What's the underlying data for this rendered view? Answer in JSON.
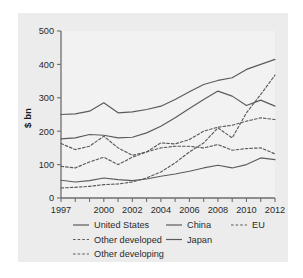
{
  "chart_data": {
    "type": "line",
    "title": "",
    "xlabel": "",
    "ylabel": "$ bn",
    "xlim": [
      1997,
      2012
    ],
    "ylim": [
      0,
      500
    ],
    "yticks": [
      0,
      100,
      200,
      300,
      400,
      500
    ],
    "yticklabels": [
      "0",
      "100",
      "200",
      "300",
      "400",
      "500"
    ],
    "x": [
      1997,
      1998,
      1999,
      2000,
      2001,
      2002,
      2003,
      2004,
      2005,
      2006,
      2007,
      2008,
      2009,
      2010,
      2011,
      2012
    ],
    "xticks": [
      1997,
      1998,
      1999,
      2000,
      2001,
      2002,
      2003,
      2004,
      2005,
      2006,
      2007,
      2008,
      2009,
      2010,
      2011,
      2012
    ],
    "xticklabels": [
      "1997",
      "",
      "",
      "2000",
      "",
      "2002",
      "",
      "2004",
      "",
      "2006",
      "",
      "2008",
      "",
      "2010",
      "",
      "2012"
    ],
    "grid": false,
    "legend_position": "below",
    "series": [
      {
        "name": "United States",
        "style": "solid",
        "color": "#5b5b5b",
        "values": [
          250,
          252,
          260,
          285,
          255,
          258,
          265,
          275,
          295,
          318,
          340,
          352,
          360,
          385,
          400,
          415
        ]
      },
      {
        "name": "Other developed",
        "style": "dashed",
        "color": "#5b5b5b",
        "values": [
          163,
          145,
          155,
          185,
          150,
          128,
          138,
          165,
          162,
          175,
          200,
          212,
          218,
          230,
          240,
          235
        ]
      },
      {
        "name": "Other developing",
        "style": "dashed",
        "color": "#5b5b5b",
        "values": [
          95,
          90,
          108,
          122,
          100,
          122,
          138,
          150,
          155,
          155,
          150,
          160,
          143,
          148,
          150,
          132
        ]
      },
      {
        "name": "China",
        "style": "solid",
        "color": "#5b5b5b",
        "values": [
          177,
          180,
          190,
          188,
          180,
          182,
          195,
          215,
          240,
          268,
          295,
          320,
          305,
          277,
          293,
          275
        ]
      },
      {
        "name": "Japan",
        "style": "solid",
        "color": "#5b5b5b",
        "values": [
          53,
          48,
          52,
          60,
          55,
          52,
          57,
          65,
          72,
          80,
          90,
          98,
          90,
          100,
          120,
          115
        ]
      },
      {
        "name": "EU",
        "style": "dashed",
        "color": "#5b5b5b",
        "values": [
          30,
          32,
          35,
          40,
          42,
          48,
          60,
          78,
          105,
          138,
          165,
          210,
          180,
          255,
          310,
          368
        ]
      }
    ]
  },
  "legend": {
    "column1": [
      {
        "label": "United States",
        "style": "solid"
      },
      {
        "label": "Other developed",
        "style": "dashed"
      },
      {
        "label": "Other developing",
        "style": "dashed"
      }
    ],
    "column2": [
      {
        "label": "China",
        "style": "solid"
      },
      {
        "label": "Japan",
        "style": "solid"
      }
    ],
    "column3": [
      {
        "label": "EU",
        "style": "dashed"
      }
    ]
  },
  "colors": {
    "panel_background": "#ececec",
    "plot_background": "#f2f2f2",
    "line": "#5b5b5b",
    "axis": "#6e6e6e",
    "text": "#2a2a2a"
  }
}
